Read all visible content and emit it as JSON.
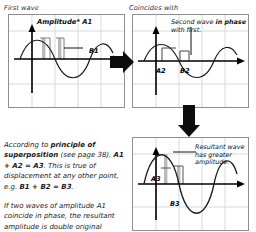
{
  "diagram": {
    "title_text": "Wave superposition: two waves in phase",
    "captions": {
      "first_wave": "First wave",
      "coincides_with": "Coincides with"
    },
    "panels": {
      "first": {
        "name": "First wave graph",
        "amplitude_label": "Amplitude* A1",
        "displacement_label": "B1"
      },
      "second": {
        "name": "Second wave graph",
        "note_plain_1": "Second wave ",
        "note_bold_1": "in phase",
        "note_plain_2": " with first.",
        "amplitude_label": "A2",
        "displacement_label": "B2"
      },
      "result": {
        "name": "Resultant wave graph",
        "note": "Resultant wave has greater amplitude.",
        "amplitude_label": "A3",
        "displacement_label": "B3"
      }
    },
    "body_text": {
      "line1_plain_a": "According to ",
      "line1_bold_a": "principle of superposition",
      "line1_plain_b": " (see page 38), ",
      "line1_bold_b": "A1 + A2 = A3",
      "line1_plain_c": ". This is true of displacement at any other point, e.g. ",
      "line1_bold_c": "B1 + B2 = B3",
      "line1_plain_d": ".",
      "paragraph2": "If two waves of amplitude A1 coincide in phase, the resultant amplitude is double original amplitude."
    },
    "arrows": {
      "right_arrow": "points from first wave panel to second wave panel",
      "down_arrow": "points from second wave panel to resultant wave panel"
    },
    "colors": {
      "grid": "#d6d9e0",
      "axis": "#000000",
      "curve": "#1a1a1a",
      "panel_border": "#8e8e8e",
      "arrow_fill": "#0d0d0d",
      "highlight_bar": "#b9b9b9"
    },
    "chart_axes": {
      "x_label": "",
      "y_label": "",
      "waveform": "sine",
      "first_amplitude": 1,
      "second_amplitude": 1,
      "resultant_amplitude": 2
    }
  }
}
